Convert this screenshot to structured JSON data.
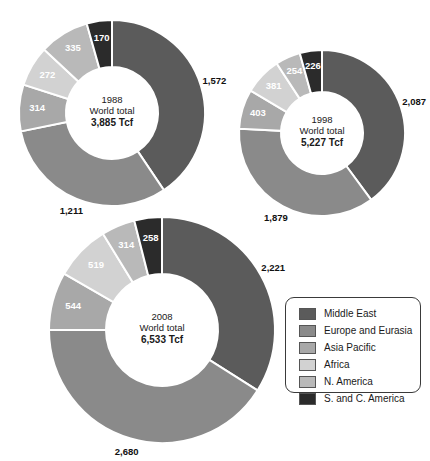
{
  "chart_data": {
    "type": "pie",
    "title": "",
    "units": "Tcf",
    "legend_position": "bottom-right",
    "categories": [
      "Middle East",
      "Europe and Eurasia",
      "Asia Pacific",
      "Africa",
      "N. America",
      "S. and C. America"
    ],
    "colors": [
      "#5b5b5b",
      "#8a8a8a",
      "#a8a8a8",
      "#d2d2d2",
      "#b9b9b9",
      "#2b2b2b"
    ],
    "charts": [
      {
        "id": "chart-1988",
        "year": "1988",
        "world_total_label": "World total",
        "total": "3,885 Tcf",
        "total_value": 3885,
        "values": [
          1572,
          1211,
          314,
          272,
          335,
          170
        ],
        "value_labels": [
          "1,572",
          "1,211",
          "314",
          "272",
          "335",
          "170"
        ],
        "series_order": [
          "Middle East",
          "Europe and Eurasia",
          "Asia Pacific",
          "Africa",
          "N. America",
          "S. and C. America"
        ]
      },
      {
        "id": "chart-1998",
        "year": "1998",
        "world_total_label": "World total",
        "total": "5,227 Tcf",
        "total_value": 5227,
        "values": [
          2087,
          1879,
          403,
          381,
          254,
          226
        ],
        "value_labels": [
          "2,087",
          "1,879",
          "403",
          "381",
          "254",
          "226"
        ],
        "series_order": [
          "Middle East",
          "Europe and Eurasia",
          "Asia Pacific",
          "Africa",
          "N. America",
          "S. and C. America"
        ]
      },
      {
        "id": "chart-2008",
        "year": "2008",
        "world_total_label": "World total",
        "total": "6,533 Tcf",
        "total_value": 6533,
        "values": [
          2221,
          2680,
          544,
          519,
          314,
          258
        ],
        "value_labels": [
          "2,221",
          "2,680",
          "544",
          "519",
          "314",
          "258"
        ],
        "series_order": [
          "Middle East",
          "Europe and Eurasia",
          "Asia Pacific",
          "Africa",
          "N. America",
          "S. and C. America"
        ]
      }
    ]
  },
  "legend": {
    "items": [
      {
        "label": "Middle East",
        "color": "#5b5b5b"
      },
      {
        "label": "Europe and Eurasia",
        "color": "#8a8a8a"
      },
      {
        "label": "Asia Pacific",
        "color": "#a8a8a8"
      },
      {
        "label": "Africa",
        "color": "#d2d2d2"
      },
      {
        "label": "N. America",
        "color": "#b9b9b9"
      },
      {
        "label": "S. and C. America",
        "color": "#2b2b2b"
      }
    ]
  },
  "geometry": {
    "donuts": [
      {
        "cx": 112,
        "cy": 113,
        "outer": 93,
        "inner": 46,
        "label_r": 78
      },
      {
        "cx": 322,
        "cy": 133,
        "outer": 83,
        "inner": 41,
        "label_r": 70
      },
      {
        "cx": 162,
        "cy": 330,
        "outer": 113,
        "inner": 56,
        "label_r": 95
      }
    ],
    "legend": {
      "left": 285,
      "top": 297,
      "width": 136,
      "height": 96
    }
  }
}
